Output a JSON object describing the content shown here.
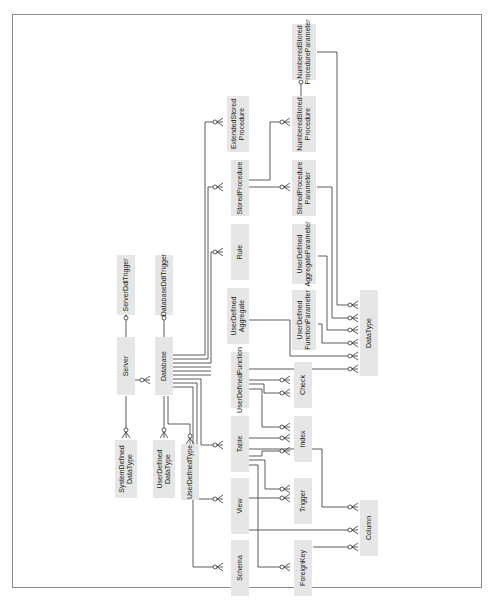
{
  "diagram": {
    "title": "",
    "orientation": "rotated-90-ccw",
    "colors": {
      "entity_fill": "#e6e6e6",
      "line": "#333333",
      "frame": "#8a8a8a"
    },
    "entities": {
      "server": "Server",
      "database": "Database",
      "server_ddl_trigger": "ServerDdlTrigger",
      "database_ddl_trigger": "DatabaseDdlTrigger",
      "system_defined_data_type": "SystemDefined\nDataType",
      "user_defined_data_type": "UserDefined\nDataType",
      "user_defined_type": "UserDefinedType",
      "extended_stored_procedure": "ExtendedStored\nProcedure",
      "stored_procedure": "StoredProcedure",
      "rule": "Rule",
      "user_defined_aggregate": "UserDefined\nAggregate",
      "user_defined_function": "UserDefinedFunction",
      "table": "Table",
      "view": "View",
      "schema": "Schema",
      "numbered_stored_procedure": "NumberedStored\nProcedure",
      "numbered_stored_procedure_parameter": "NumberedStored\nProcedureParameter",
      "stored_procedure_parameter": "StoredProcedure\nParameter",
      "user_defined_aggregate_parameter": "UserDefined\nAggregateParameter",
      "user_defined_function_parameter": "UserDefined\nFunctionParameter",
      "check": "Check",
      "index": "Index",
      "trigger": "Trigger",
      "foreign_key": "ForeignKey",
      "data_type": "DataType",
      "column": "Column"
    },
    "relationships": [
      [
        "Server",
        "Database"
      ],
      [
        "Server",
        "ServerDdlTrigger"
      ],
      [
        "Server",
        "SystemDefinedDataType"
      ],
      [
        "Database",
        "DatabaseDdlTrigger"
      ],
      [
        "Database",
        "UserDefinedDataType"
      ],
      [
        "Database",
        "UserDefinedType"
      ],
      [
        "Database",
        "ExtendedStoredProcedure"
      ],
      [
        "Database",
        "StoredProcedure"
      ],
      [
        "Database",
        "Rule"
      ],
      [
        "Database",
        "Table"
      ],
      [
        "Database",
        "View"
      ],
      [
        "Database",
        "Schema"
      ],
      [
        "StoredProcedure",
        "NumberedStoredProcedure"
      ],
      [
        "StoredProcedure",
        "StoredProcedureParameter"
      ],
      [
        "NumberedStoredProcedure",
        "NumberedStoredProcedureParameter"
      ],
      [
        "UserDefinedFunction",
        "Check"
      ],
      [
        "UserDefinedFunction",
        "Index"
      ],
      [
        "Table",
        "Check"
      ],
      [
        "Table",
        "Index"
      ],
      [
        "Table",
        "Trigger"
      ],
      [
        "Table",
        "ForeignKey"
      ],
      [
        "Table",
        "Column"
      ],
      [
        "View",
        "Trigger"
      ],
      [
        "View",
        "Index"
      ],
      [
        "View",
        "Column"
      ],
      [
        "ForeignKey",
        "Column"
      ],
      [
        "NumberedStoredProcedureParameter",
        "DataType"
      ],
      [
        "StoredProcedureParameter",
        "DataType"
      ],
      [
        "UserDefinedAggregateParameter",
        "DataType"
      ],
      [
        "UserDefinedFunctionParameter",
        "DataType"
      ],
      [
        "UserDefinedAggregate",
        "DataType"
      ],
      [
        "UserDefinedFunction",
        "DataType"
      ]
    ]
  }
}
